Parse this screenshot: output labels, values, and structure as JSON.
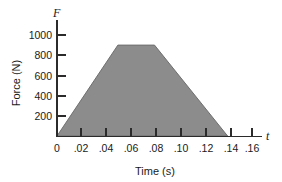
{
  "chart_data": {
    "type": "area",
    "title": "",
    "xlabel": "Time (s)",
    "ylabel": "Force (N)",
    "x_axis_symbol": "t",
    "y_axis_symbol": "F",
    "xlim": [
      0,
      0.17
    ],
    "ylim": [
      0,
      1100
    ],
    "grid": false,
    "legend": null,
    "x_ticks": [
      {
        "value": 0,
        "label": "0"
      },
      {
        "value": 0.02,
        "label": ".02"
      },
      {
        "value": 0.04,
        "label": ".04"
      },
      {
        "value": 0.06,
        "label": ".06"
      },
      {
        "value": 0.08,
        "label": ".08"
      },
      {
        "value": 0.1,
        "label": ".10"
      },
      {
        "value": 0.12,
        "label": ".12"
      },
      {
        "value": 0.14,
        "label": ".14"
      },
      {
        "value": 0.16,
        "label": ".16"
      }
    ],
    "y_ticks": [
      {
        "value": 200,
        "label": "200"
      },
      {
        "value": 400,
        "label": "400"
      },
      {
        "value": 600,
        "label": "600"
      },
      {
        "value": 800,
        "label": "800"
      },
      {
        "value": 1000,
        "label": "1000"
      }
    ],
    "series": [
      {
        "name": "Force vs time",
        "fill_color": "#8c8c8c",
        "x": [
          0,
          0.05,
          0.08,
          0.14
        ],
        "values": [
          0,
          900,
          900,
          0
        ]
      }
    ],
    "peak_force": 900,
    "rise_end_time": 0.05,
    "plateau_end_time": 0.08,
    "end_time": 0.14
  }
}
